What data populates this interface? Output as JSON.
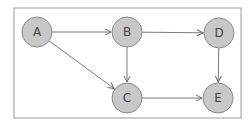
{
  "diagram": {
    "type": "directed-graph",
    "frame": {
      "x": 14,
      "y": 8,
      "width": 227,
      "height": 110,
      "stroke": "#9a9a9a"
    },
    "colors": {
      "node_fill": "#c8c8c8",
      "node_stroke": "#8a8a8a",
      "edge": "#6a6a6a",
      "label": "#444444"
    },
    "nodes": [
      {
        "id": "A",
        "label": "A",
        "cx": 37,
        "cy": 32,
        "r": 15
      },
      {
        "id": "B",
        "label": "B",
        "cx": 127,
        "cy": 32,
        "r": 15
      },
      {
        "id": "D",
        "label": "D",
        "cx": 219,
        "cy": 33,
        "r": 15
      },
      {
        "id": "C",
        "label": "C",
        "cx": 127,
        "cy": 98,
        "r": 15
      },
      {
        "id": "E",
        "label": "E",
        "cx": 218,
        "cy": 98,
        "r": 15
      }
    ],
    "edges": [
      {
        "from": "A",
        "to": "B"
      },
      {
        "from": "A",
        "to": "C"
      },
      {
        "from": "B",
        "to": "D"
      },
      {
        "from": "B",
        "to": "C"
      },
      {
        "from": "D",
        "to": "E"
      },
      {
        "from": "C",
        "to": "E"
      }
    ]
  }
}
